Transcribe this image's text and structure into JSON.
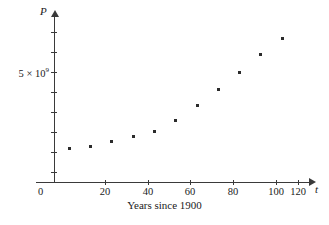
{
  "chart_data": {
    "type": "scatter",
    "title": "",
    "xlabel": "Years since 1900",
    "ylabel": "P",
    "x_axis_symbol": "t",
    "y_axis_symbol": "P",
    "x": [
      10,
      20,
      30,
      40,
      50,
      60,
      70,
      80,
      90,
      100,
      110
    ],
    "values": [
      1650000000,
      1750000000,
      2070000000,
      2300000000,
      2560000000,
      3040000000,
      3710000000,
      4450000000,
      5280000000,
      6080000000,
      6870000000
    ],
    "y_display_units": "population",
    "xlim": [
      0,
      125
    ],
    "ylim": [
      0,
      8000000000
    ],
    "xticks": [
      0,
      20,
      40,
      60,
      80,
      100,
      120
    ],
    "xticklabels": [
      "0",
      "20",
      "40",
      "60",
      "80",
      "100",
      "120"
    ],
    "yticks": [
      1000000000,
      2000000000,
      3000000000,
      4000000000,
      5000000000,
      6000000000,
      7000000000,
      8000000000
    ],
    "yticklabels": [
      "",
      "",
      "",
      "",
      "5 × 10⁹",
      "",
      "",
      ""
    ],
    "y_labeled_tick_value": "5 × 10",
    "y_labeled_tick_exponent": "9",
    "origin_label": "0",
    "grid": false,
    "legend": null,
    "marker": "square-dot",
    "marker_color": "#2b2b2b",
    "axis_color": "#3a3a3a",
    "background": "#ffffff"
  },
  "axes": {
    "x_tick_labels": [
      "20",
      "40",
      "60",
      "80",
      "100",
      "120"
    ],
    "origin": "0",
    "x_symbol": "t",
    "y_symbol": "P",
    "caption": "Years since 1900"
  },
  "points": [
    {
      "t": "10",
      "px": 68,
      "py": 147
    },
    {
      "t": "20",
      "px": 89,
      "py": 145
    },
    {
      "t": "30",
      "px": 110,
      "py": 140
    },
    {
      "t": "40",
      "px": 132,
      "py": 135
    },
    {
      "t": "50",
      "px": 153,
      "py": 130
    },
    {
      "t": "60",
      "px": 174,
      "py": 119
    },
    {
      "t": "70",
      "px": 196,
      "py": 104
    },
    {
      "t": "80",
      "px": 217,
      "py": 88
    },
    {
      "t": "90",
      "px": 238,
      "py": 71
    },
    {
      "t": "100",
      "px": 259,
      "py": 53
    },
    {
      "t": "110",
      "px": 281,
      "py": 37
    }
  ],
  "xtick_positions": [
    {
      "label": "20",
      "px": 105
    },
    {
      "label": "40",
      "px": 148
    },
    {
      "label": "60",
      "px": 190
    },
    {
      "label": "80",
      "px": 233
    },
    {
      "label": "100",
      "px": 276
    },
    {
      "label": "120",
      "px": 298
    }
  ],
  "ytick_positions": [
    32,
    52,
    72,
    92,
    112,
    132,
    152,
    172
  ]
}
